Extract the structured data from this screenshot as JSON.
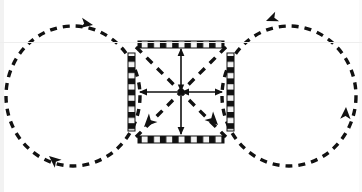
{
  "figure": {
    "title": "Figure-eight trajectory diagram with central square frame",
    "type": "diagram",
    "canvas": {
      "width": 362,
      "height": 192,
      "background": "#ffffff"
    },
    "colors": {
      "stroke": "#111111",
      "background": "#ffffff",
      "bar_dark": "#111111",
      "bar_light": "#f4f4f4",
      "bar_outline": "#111111",
      "edge_band": "#f2f2f2",
      "faint_rule": "#eeeeee"
    },
    "center": {
      "x": 181,
      "y": 92
    },
    "square": {
      "label": "central-square-frame",
      "left": 131,
      "right": 231,
      "top": 44,
      "bottom": 140,
      "bar_thickness": 7,
      "segments_per_bar": 7,
      "description": "Four striped bars forming a square frame"
    },
    "bars": [
      {
        "name": "top-bar",
        "orientation": "horizontal",
        "x": 138,
        "y": 41,
        "length": 86,
        "thickness": 7
      },
      {
        "name": "bottom-bar",
        "orientation": "horizontal",
        "x": 138,
        "y": 137,
        "length": 86,
        "thickness": 7
      },
      {
        "name": "left-bar",
        "orientation": "vertical",
        "x": 128,
        "y": 52,
        "length": 78,
        "thickness": 7
      },
      {
        "name": "right-bar",
        "orientation": "vertical",
        "x": 227,
        "y": 52,
        "length": 78,
        "thickness": 7
      }
    ],
    "center_arrows": [
      {
        "name": "horizontal-double-arrow",
        "from": [
          139,
          92
        ],
        "to": [
          223,
          92
        ],
        "heads": "both",
        "style": "solid"
      },
      {
        "name": "vertical-double-arrow",
        "from": [
          181,
          49
        ],
        "to": [
          181,
          134
        ],
        "heads": "both",
        "style": "solid"
      },
      {
        "name": "diagonal-arrow-nw-se",
        "from": [
          139,
          50
        ],
        "to": [
          223,
          134
        ],
        "heads": "one-inward",
        "style": "dashed"
      },
      {
        "name": "diagonal-arrow-ne-sw",
        "from": [
          223,
          50
        ],
        "to": [
          139,
          134
        ],
        "heads": "one-inward",
        "style": "dashed"
      }
    ],
    "loops": [
      {
        "name": "left-loop",
        "center_x": 73,
        "center_y": 96,
        "radius_x": 67,
        "radius_y": 70,
        "style": "dashed",
        "direction": "counter-clockwise",
        "arrowheads": [
          {
            "name": "left-loop-top-arrowhead",
            "x": 93,
            "y": 25,
            "angle": 200,
            "direction": "left"
          },
          {
            "name": "left-loop-bottom-arrowhead",
            "x": 50,
            "y": 155,
            "angle": 38,
            "direction": "down-right"
          }
        ]
      },
      {
        "name": "right-loop",
        "center_x": 289,
        "center_y": 96,
        "radius_x": 67,
        "radius_y": 70,
        "style": "dashed",
        "direction": "clockwise",
        "arrowheads": [
          {
            "name": "right-loop-top-arrowhead",
            "x": 264,
            "y": 22,
            "angle": -22,
            "direction": "up-right"
          },
          {
            "name": "right-loop-right-arrowhead",
            "x": 345,
            "y": 110,
            "angle": 92,
            "direction": "down"
          }
        ]
      }
    ],
    "dash_pattern": {
      "dash": 7,
      "gap": 6,
      "stroke_width": 3.4
    },
    "faint_rules": [
      {
        "name": "upper-faint-rule",
        "y": 42
      }
    ]
  }
}
